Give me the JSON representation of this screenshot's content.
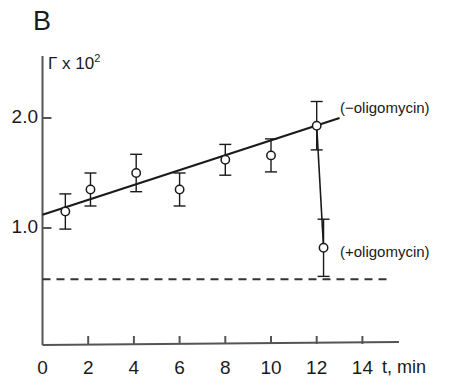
{
  "panel": {
    "label": "B"
  },
  "axes": {
    "y_title_base": "Γ x 10",
    "y_title_exponent": "2",
    "y_ticks": [
      {
        "label": "1.0",
        "value": 1.0
      },
      {
        "label": "2.0",
        "value": 2.0
      }
    ],
    "x_title": "t, min",
    "x_ticks": [
      {
        "label": "0",
        "value": 0
      },
      {
        "label": "2",
        "value": 2
      },
      {
        "label": "4",
        "value": 4
      },
      {
        "label": "6",
        "value": 6
      },
      {
        "label": "8",
        "value": 8
      },
      {
        "label": "10",
        "value": 10
      },
      {
        "label": "12",
        "value": 12
      },
      {
        "label": "14",
        "value": 14
      }
    ]
  },
  "labels": {
    "minus_oligomycin": "(−oligomycin)",
    "plus_oligomycin": "(+oligomycin)"
  },
  "colors": {
    "ink": "#1a1a1a",
    "axis": "#555555",
    "marker_fill": "#ffffff",
    "baseline": "#333333"
  },
  "chart_data": {
    "type": "scatter",
    "title": "B",
    "xlabel": "t, min",
    "ylabel": "Γ x 10²",
    "xlim": [
      0,
      15.2
    ],
    "ylim": [
      0.28,
      2.4
    ],
    "grid": false,
    "legend_position": "inline-right",
    "series": [
      {
        "name": "(−oligomycin)",
        "marker": "open-circle",
        "x": [
          1.0,
          2.1,
          4.1,
          6.0,
          8.0,
          10.0,
          12.0
        ],
        "y": [
          1.15,
          1.35,
          1.5,
          1.35,
          1.62,
          1.66,
          1.93
        ],
        "yerr": [
          0.16,
          0.15,
          0.17,
          0.15,
          0.14,
          0.15,
          0.22
        ]
      },
      {
        "name": "(+oligomycin)",
        "marker": "open-circle",
        "x": [
          12.3
        ],
        "y": [
          0.82
        ],
        "yerr": [
          0.26
        ]
      }
    ],
    "fit_line": {
      "name": "linear-regression",
      "x": [
        0.0,
        13.0
      ],
      "y": [
        1.12,
        2.0
      ]
    },
    "drop_line": {
      "name": "oligomycin-drop",
      "x": [
        12.0,
        12.3
      ],
      "y": [
        1.93,
        0.82
      ]
    },
    "baseline": {
      "name": "dashed-baseline",
      "y": 0.535,
      "style": "dashed",
      "x_range": [
        0.0,
        15.2
      ]
    },
    "annotations": [
      {
        "text": "(−oligomycin)",
        "x": 13.1,
        "y": 2.05
      },
      {
        "text": "(+oligomycin)",
        "x": 13.1,
        "y": 0.83
      }
    ]
  }
}
